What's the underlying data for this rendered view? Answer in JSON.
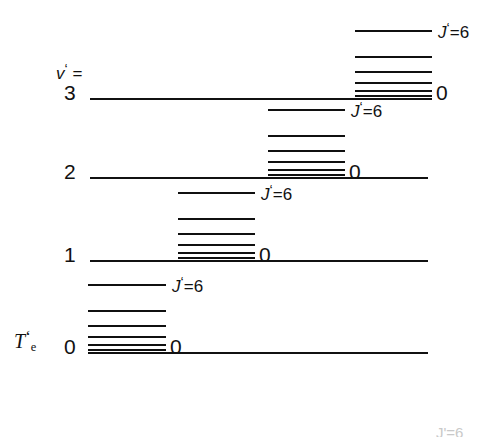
{
  "figure": {
    "type": "energy-level-diagram",
    "background_color": "#ffffff",
    "line_color": "#111111",
    "axis_label_left_top": "v' =",
    "axis_label_left_bottom": "Te'"
  },
  "labels": {
    "v_axis": {
      "symbol": "v",
      "prime": "‘",
      "equals": " ="
    },
    "te_axis": {
      "symbol": "T",
      "subscript": "e",
      "prime": "‘"
    },
    "j_top": "J'=6",
    "j_bottom": "0"
  },
  "levels": [
    {
      "v": "3",
      "baseline_y": 98,
      "baseline_x_start": 90,
      "baseline_x_end": 432,
      "ladder_x_start": 355,
      "ladder_x_end": 432,
      "v_label": "3",
      "j_max_label": "J'=6",
      "j_min_label": "0",
      "j_values": [
        0,
        1,
        2,
        3,
        4,
        5,
        6
      ],
      "rung_offsets": [
        0,
        3,
        8,
        16,
        27,
        42,
        68
      ]
    },
    {
      "v": "2",
      "baseline_y": 177,
      "baseline_x_start": 90,
      "baseline_x_end": 428,
      "ladder_x_start": 268,
      "ladder_x_end": 345,
      "v_label": "2",
      "j_max_label": "J'=6",
      "j_min_label": "0",
      "j_values": [
        0,
        1,
        2,
        3,
        4,
        5,
        6
      ],
      "rung_offsets": [
        0,
        3,
        8,
        16,
        27,
        42,
        68
      ]
    },
    {
      "v": "1",
      "baseline_y": 260,
      "baseline_x_start": 90,
      "baseline_x_end": 428,
      "ladder_x_start": 178,
      "ladder_x_end": 255,
      "v_label": "1",
      "j_max_label": "J'=6",
      "j_min_label": "0",
      "j_values": [
        0,
        1,
        2,
        3,
        4,
        5,
        6
      ],
      "rung_offsets": [
        0,
        3,
        8,
        16,
        27,
        42,
        68
      ]
    },
    {
      "v": "0",
      "baseline_y": 352,
      "baseline_x_start": 88,
      "baseline_x_end": 428,
      "ladder_x_start": 88,
      "ladder_x_end": 166,
      "v_label": "0",
      "j_max_label": "J'=6",
      "j_min_label": "0",
      "j_values": [
        0,
        1,
        2,
        3,
        4,
        5,
        6
      ],
      "rung_offsets": [
        0,
        3,
        8,
        16,
        27,
        42,
        68
      ]
    }
  ],
  "clipped_footer_label": "J'=6",
  "chart_data": {
    "type": "line",
    "title": "",
    "xlabel": "",
    "ylabel": "",
    "series": [
      {
        "name": "v'=0",
        "categories": [
          0,
          1,
          2,
          3,
          4,
          5,
          6
        ],
        "values": [
          352,
          349,
          344,
          336,
          325,
          310,
          284
        ]
      },
      {
        "name": "v'=1",
        "categories": [
          0,
          1,
          2,
          3,
          4,
          5,
          6
        ],
        "values": [
          260,
          257,
          252,
          244,
          233,
          218,
          192
        ]
      },
      {
        "name": "v'=2",
        "categories": [
          0,
          1,
          2,
          3,
          4,
          5,
          6
        ],
        "values": [
          177,
          174,
          169,
          161,
          150,
          135,
          109
        ]
      },
      {
        "name": "v'=3",
        "categories": [
          0,
          1,
          2,
          3,
          4,
          5,
          6
        ],
        "values": [
          98,
          95,
          90,
          82,
          71,
          56,
          30
        ]
      }
    ]
  }
}
